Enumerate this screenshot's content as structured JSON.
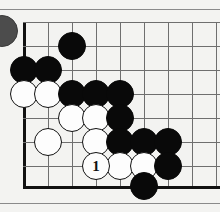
{
  "figure": {
    "board": {
      "grid_spacing": 24,
      "origin_x": 24,
      "origin_y": 22,
      "columns": 9,
      "rows": 8,
      "left_edge_x": 24,
      "bottom_edge_y": 186,
      "line_color": "#6f6f6f",
      "edge_color": "#111111",
      "background_color": "#f3f3f1"
    },
    "rules": {
      "top_y": 9,
      "bottom_y": 203,
      "color": "#8a8a8a"
    },
    "cut_stone": {
      "name": "partial-stone-left-edge",
      "color": "#4c4c4c",
      "x": -14,
      "y": 15
    },
    "stones": [
      {
        "color": "black",
        "col": 3,
        "row": 2,
        "label": ""
      },
      {
        "color": "black",
        "col": 1,
        "row": 3,
        "label": ""
      },
      {
        "color": "black",
        "col": 2,
        "row": 3,
        "label": ""
      },
      {
        "color": "white",
        "col": 1,
        "row": 4,
        "label": ""
      },
      {
        "color": "white",
        "col": 2,
        "row": 4,
        "label": ""
      },
      {
        "color": "black",
        "col": 3,
        "row": 4,
        "label": ""
      },
      {
        "color": "black",
        "col": 4,
        "row": 4,
        "label": ""
      },
      {
        "color": "black",
        "col": 5,
        "row": 4,
        "label": ""
      },
      {
        "color": "white",
        "col": 3,
        "row": 5,
        "label": ""
      },
      {
        "color": "white",
        "col": 4,
        "row": 5,
        "label": ""
      },
      {
        "color": "black",
        "col": 5,
        "row": 5,
        "label": ""
      },
      {
        "color": "white",
        "col": 2,
        "row": 6,
        "label": ""
      },
      {
        "color": "white",
        "col": 4,
        "row": 6,
        "label": ""
      },
      {
        "color": "black",
        "col": 5,
        "row": 6,
        "label": ""
      },
      {
        "color": "black",
        "col": 6,
        "row": 6,
        "label": ""
      },
      {
        "color": "black",
        "col": 7,
        "row": 6,
        "label": ""
      },
      {
        "color": "white",
        "col": 4,
        "row": 7,
        "label": "1"
      },
      {
        "color": "white",
        "col": 5,
        "row": 7,
        "label": ""
      },
      {
        "color": "white",
        "col": 6,
        "row": 7,
        "label": ""
      },
      {
        "color": "black",
        "col": 7,
        "row": 7,
        "label": ""
      },
      {
        "color": "black",
        "col": 6,
        "row": 8,
        "label": ""
      }
    ]
  }
}
